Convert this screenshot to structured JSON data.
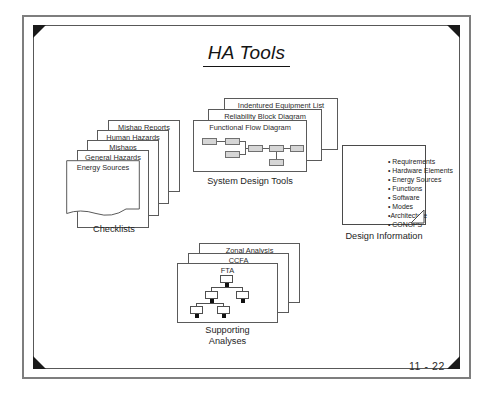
{
  "slide": {
    "title": "HA Tools",
    "page_number": "11 - 22"
  },
  "checklists": {
    "group_label": "Checklists",
    "cards": [
      {
        "label": "Mishap Reports"
      },
      {
        "label": "Human Hazards"
      },
      {
        "label": "Mishaps"
      },
      {
        "label": "General Hazards"
      },
      {
        "label": "Energy Sources"
      }
    ]
  },
  "system_design_tools": {
    "group_label": "System Design Tools",
    "cards": [
      {
        "label": "Indentured Equipment List"
      },
      {
        "label": "Reliability Block Diagram"
      },
      {
        "label": "Functional Flow Diagram"
      }
    ]
  },
  "supporting_analyses": {
    "group_label_line1": "Supporting",
    "group_label_line2": "Analyses",
    "cards": [
      {
        "label": "Zonal Analysis"
      },
      {
        "label": "CCFA"
      },
      {
        "label": "FTA"
      }
    ]
  },
  "design_information": {
    "group_label": "Design Information",
    "items": [
      "• Requirements",
      "• Hardware Elements",
      "• Energy Sources",
      "• Functions",
      "• Software",
      "• Modes",
      "•Architecture",
      "• CONOPS"
    ]
  },
  "colors": {
    "ink": "#1a1a1a",
    "frame": "#7e7e7e",
    "card_border": "#5a5a5a",
    "flow_box_fill": "#d6d6d6",
    "corner_marker": "#1a1a1a"
  }
}
